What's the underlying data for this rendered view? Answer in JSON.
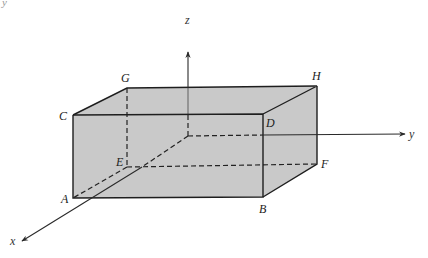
{
  "diagram": {
    "corner_fragment": "y",
    "vertices": [
      {
        "id": "A",
        "label": "A"
      },
      {
        "id": "B",
        "label": "B"
      },
      {
        "id": "C",
        "label": "C"
      },
      {
        "id": "D",
        "label": "D"
      },
      {
        "id": "E",
        "label": "E"
      },
      {
        "id": "F",
        "label": "F"
      },
      {
        "id": "G",
        "label": "G"
      },
      {
        "id": "H",
        "label": "H"
      }
    ],
    "axes": {
      "x": "x",
      "y": "y",
      "z": "z"
    },
    "visible_edges": [
      "C-D",
      "C-A",
      "A-B",
      "B-D",
      "C-G",
      "G-H",
      "D-H",
      "H-F",
      "F-B"
    ],
    "hidden_edges": [
      "G-E",
      "E-F",
      "E-A"
    ],
    "colors": {
      "face_fill": "#c9c9c9",
      "edge": "#1e1e1e",
      "background": "#ffffff"
    }
  }
}
